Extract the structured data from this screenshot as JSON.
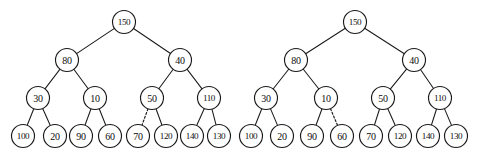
{
  "figure": {
    "background_color": "#ffffff",
    "stroke_color": "#1a1a1a",
    "node_fill_color": "#ffffff",
    "width": 477,
    "height": 159,
    "node_radius": 11.5,
    "level_y": [
      22,
      60,
      98,
      136
    ]
  },
  "trees": [
    {
      "name": "left-tree",
      "caption": "",
      "nodes": [
        {
          "id": "L-150",
          "label": "150",
          "x": 124,
          "y": 22,
          "level": 0
        },
        {
          "id": "L-80",
          "label": "80",
          "x": 67,
          "y": 60,
          "level": 1
        },
        {
          "id": "L-40",
          "label": "40",
          "x": 180,
          "y": 60,
          "level": 1
        },
        {
          "id": "L-30",
          "label": "30",
          "x": 38,
          "y": 98,
          "level": 2
        },
        {
          "id": "L-10",
          "label": "10",
          "x": 95,
          "y": 98,
          "level": 2
        },
        {
          "id": "L-50",
          "label": "50",
          "x": 152,
          "y": 98,
          "level": 2
        },
        {
          "id": "L-110",
          "label": "110",
          "x": 209,
          "y": 98,
          "level": 2
        },
        {
          "id": "L-100",
          "label": "100",
          "x": 23,
          "y": 136,
          "level": 3
        },
        {
          "id": "L-20",
          "label": "20",
          "x": 55,
          "y": 136,
          "level": 3
        },
        {
          "id": "L-90",
          "label": "90",
          "x": 81,
          "y": 136,
          "level": 3
        },
        {
          "id": "L-60",
          "label": "60",
          "x": 110,
          "y": 136,
          "level": 3
        },
        {
          "id": "L-70",
          "label": "70",
          "x": 138,
          "y": 136,
          "level": 3
        },
        {
          "id": "L-120",
          "label": "120",
          "x": 166,
          "y": 136,
          "level": 3
        },
        {
          "id": "L-140",
          "label": "140",
          "x": 192,
          "y": 136,
          "level": 3
        },
        {
          "id": "L-130",
          "label": "130",
          "x": 219,
          "y": 136,
          "level": 3
        }
      ],
      "edges": [
        {
          "from": "L-150",
          "to": "L-80",
          "style": "solid"
        },
        {
          "from": "L-150",
          "to": "L-40",
          "style": "solid"
        },
        {
          "from": "L-80",
          "to": "L-30",
          "style": "solid"
        },
        {
          "from": "L-80",
          "to": "L-10",
          "style": "solid"
        },
        {
          "from": "L-40",
          "to": "L-50",
          "style": "solid"
        },
        {
          "from": "L-40",
          "to": "L-110",
          "style": "solid"
        },
        {
          "from": "L-30",
          "to": "L-100",
          "style": "solid"
        },
        {
          "from": "L-30",
          "to": "L-20",
          "style": "solid"
        },
        {
          "from": "L-10",
          "to": "L-90",
          "style": "solid"
        },
        {
          "from": "L-10",
          "to": "L-60",
          "style": "solid"
        },
        {
          "from": "L-50",
          "to": "L-70",
          "style": "dashed"
        },
        {
          "from": "L-50",
          "to": "L-120",
          "style": "solid"
        },
        {
          "from": "L-110",
          "to": "L-140",
          "style": "solid"
        },
        {
          "from": "L-110",
          "to": "L-130",
          "style": "solid"
        }
      ]
    },
    {
      "name": "right-tree",
      "caption": "",
      "nodes": [
        {
          "id": "R-150",
          "label": "150",
          "x": 355,
          "y": 22,
          "level": 0
        },
        {
          "id": "R-80",
          "label": "80",
          "x": 296,
          "y": 60,
          "level": 1
        },
        {
          "id": "R-40",
          "label": "40",
          "x": 414,
          "y": 60,
          "level": 1
        },
        {
          "id": "R-30",
          "label": "30",
          "x": 266,
          "y": 98,
          "level": 2
        },
        {
          "id": "R-10",
          "label": "10",
          "x": 326,
          "y": 98,
          "level": 2
        },
        {
          "id": "R-50",
          "label": "50",
          "x": 383,
          "y": 98,
          "level": 2
        },
        {
          "id": "R-110",
          "label": "110",
          "x": 440,
          "y": 98,
          "level": 2
        },
        {
          "id": "R-100",
          "label": "100",
          "x": 251,
          "y": 136,
          "level": 3
        },
        {
          "id": "R-20",
          "label": "20",
          "x": 282,
          "y": 136,
          "level": 3
        },
        {
          "id": "R-90",
          "label": "90",
          "x": 312,
          "y": 136,
          "level": 3
        },
        {
          "id": "R-60",
          "label": "60",
          "x": 342,
          "y": 136,
          "level": 3
        },
        {
          "id": "R-70",
          "label": "70",
          "x": 371,
          "y": 136,
          "level": 3
        },
        {
          "id": "R-120",
          "label": "120",
          "x": 400,
          "y": 136,
          "level": 3
        },
        {
          "id": "R-140",
          "label": "140",
          "x": 428,
          "y": 136,
          "level": 3
        },
        {
          "id": "R-130",
          "label": "130",
          "x": 456,
          "y": 136,
          "level": 3
        }
      ],
      "edges": [
        {
          "from": "R-150",
          "to": "R-80",
          "style": "solid"
        },
        {
          "from": "R-150",
          "to": "R-40",
          "style": "solid"
        },
        {
          "from": "R-80",
          "to": "R-30",
          "style": "solid"
        },
        {
          "from": "R-80",
          "to": "R-10",
          "style": "solid"
        },
        {
          "from": "R-40",
          "to": "R-50",
          "style": "solid"
        },
        {
          "from": "R-40",
          "to": "R-110",
          "style": "solid"
        },
        {
          "from": "R-30",
          "to": "R-100",
          "style": "solid"
        },
        {
          "from": "R-30",
          "to": "R-20",
          "style": "solid"
        },
        {
          "from": "R-10",
          "to": "R-90",
          "style": "solid"
        },
        {
          "from": "R-10",
          "to": "R-60",
          "style": "dashed"
        },
        {
          "from": "R-50",
          "to": "R-70",
          "style": "solid"
        },
        {
          "from": "R-50",
          "to": "R-120",
          "style": "solid"
        },
        {
          "from": "R-110",
          "to": "R-140",
          "style": "solid"
        },
        {
          "from": "R-110",
          "to": "R-130",
          "style": "solid"
        }
      ]
    }
  ]
}
